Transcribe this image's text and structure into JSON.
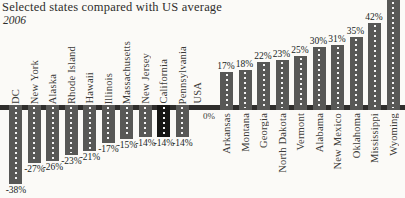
{
  "title": "Selected states compared with US average",
  "subtitle": "2006",
  "axis": {
    "usa_label": "USA",
    "zero_label": "0%"
  },
  "colors": {
    "bar": "#585856",
    "bar_highlight": "#161614",
    "axis_line": "#2f2e2c",
    "background": "#fbfaf7",
    "text": "#2e2d2b"
  },
  "chart_data": {
    "type": "bar",
    "title": "Selected states compared with US average",
    "subtitle": "2006",
    "legend_position": "none",
    "grid": false,
    "baseline": {
      "label": "USA",
      "value_label": "0%",
      "value": 0
    },
    "below_average": {
      "categories": [
        "DC",
        "New York",
        "Alaska",
        "Rhode Island",
        "Hawaii",
        "Illinois",
        "Massachusetts",
        "New Jersey",
        "California",
        "Pennsylvania"
      ],
      "values": [
        -38,
        -27,
        -26,
        -23,
        -21,
        -17,
        -15,
        -14,
        -14,
        -14
      ],
      "labels": [
        "-38%",
        "-27%",
        "-26%",
        "-23%",
        "-21%",
        "-17%",
        "-15%",
        "-14%",
        "-14%",
        "-14%"
      ],
      "highlighted": [
        "California"
      ]
    },
    "above_average": {
      "categories": [
        "Arkansas",
        "Montana",
        "Georgia",
        "North Dakota",
        "Vermont",
        "Alabama",
        "New Mexico",
        "Oklahoma",
        "Mississippi",
        "Wyoming"
      ],
      "values": [
        17,
        18,
        22,
        23,
        25,
        30,
        31,
        35,
        42,
        null
      ],
      "labels": [
        "17%",
        "18%",
        "22%",
        "23%",
        "25%",
        "30%",
        "31%",
        "35%",
        "42%",
        ""
      ],
      "note": "Wyoming bar extends beyond the top edge of the chart; its value label is not visible"
    }
  }
}
